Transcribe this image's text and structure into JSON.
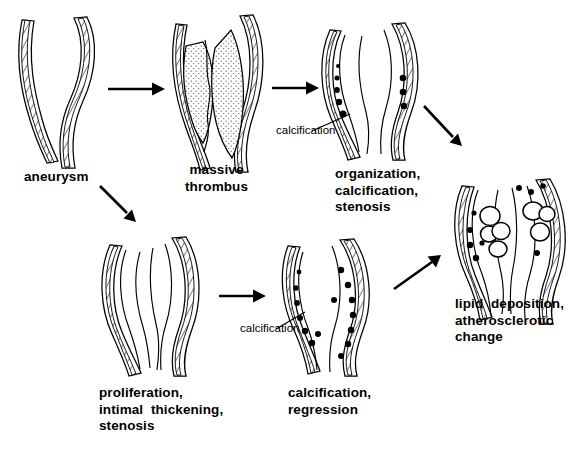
{
  "diagram": {
    "ink_color": "#000000",
    "background_color": "#ffffff"
  },
  "nodes": [
    {
      "id": "aneurysm",
      "label": "aneurysm",
      "label_lines": [
        "aneurysm"
      ],
      "features": "dilated vessel, hatched media wall, patent lumen"
    },
    {
      "id": "massive-thrombus",
      "label": "massive thrombus",
      "label_lines": [
        "massive",
        "thrombus"
      ],
      "features": "stippled mural thrombus filling dilated sac, narrow serpiginous channel"
    },
    {
      "id": "organization-calcification-stenosis",
      "label": "organization, calcification, stenosis",
      "label_lines": [
        "organization,",
        "calcification,",
        "stenosis"
      ],
      "features": "organized thrombus with calcium deposits in wall, narrowed lumen",
      "calcification_dots_left": 5,
      "calcification_dots_right": 3
    },
    {
      "id": "proliferation-intimal-thickening-stenosis",
      "label": "proliferation, intimal thickening, stenosis",
      "label_lines": [
        "proliferation,",
        "intimal  thickening,",
        "stenosis"
      ],
      "features": "thickened intima narrowing lumen, no calcium"
    },
    {
      "id": "calcification-regression",
      "label": "calcification, regression",
      "label_lines": [
        "calcification,",
        "regression"
      ],
      "features": "numerous calcium deposits along both walls, regressed dilatation",
      "calcification_dots_left": 7,
      "calcification_dots_right": 8
    },
    {
      "id": "lipid-deposition-atherosclerotic-change",
      "label": "lipid deposition, atherosclerotic change",
      "label_lines": [
        "lipid  deposition,",
        "atherosclerotic",
        "change"
      ],
      "features": "clustered lipid vacuoles (open circles) plus calcium dots",
      "vacuoles_left": 4,
      "vacuoles_right": 3,
      "calcification_dots_left": 5,
      "calcification_dots_right": 4
    }
  ],
  "annotations": [
    {
      "id": "calcification-top",
      "label": "calcification",
      "points_to": "organization-calcification-stenosis"
    },
    {
      "id": "calcification-bottom",
      "label": "calcification",
      "points_to": "calcification-regression"
    }
  ],
  "edges": [
    {
      "id": "aneurysm-to-thrombus",
      "from": "aneurysm",
      "to": "massive-thrombus",
      "direction": "right"
    },
    {
      "id": "thrombus-to-organization",
      "from": "massive-thrombus",
      "to": "organization-calcification-stenosis",
      "direction": "right"
    },
    {
      "id": "aneurysm-to-proliferation",
      "from": "aneurysm",
      "to": "proliferation-intimal-thickening-stenosis",
      "direction": "down-right"
    },
    {
      "id": "organization-to-lipid",
      "from": "organization-calcification-stenosis",
      "to": "lipid-deposition-atherosclerotic-change",
      "direction": "down-right"
    },
    {
      "id": "proliferation-to-calcification",
      "from": "proliferation-intimal-thickening-stenosis",
      "to": "calcification-regression",
      "direction": "right"
    },
    {
      "id": "calcification-to-lipid",
      "from": "calcification-regression",
      "to": "lipid-deposition-atherosclerotic-change",
      "direction": "up-right"
    }
  ]
}
